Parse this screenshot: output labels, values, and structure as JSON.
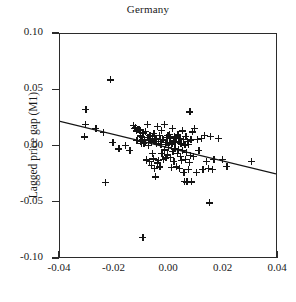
{
  "chart_data": {
    "type": "scatter",
    "title": "Germany",
    "xlabel": "",
    "ylabel": "Lagged price gap (M1)",
    "xlim": [
      -0.04,
      0.04
    ],
    "ylim": [
      -0.1,
      0.1
    ],
    "grid": false,
    "legend": null,
    "marker_style": "plus",
    "xticks": [
      "-0.04",
      "-0.02",
      "0.00",
      "0.02",
      "0.04"
    ],
    "xtick_values": [
      -0.04,
      -0.02,
      0.0,
      0.02,
      0.04
    ],
    "yticks": [
      "0.10",
      "0.05",
      "0.00",
      "-0.05",
      "-0.10"
    ],
    "ytick_values": [
      0.1,
      0.05,
      0.0,
      -0.05,
      -0.1
    ],
    "trend_line": {
      "type": "linear-fit",
      "x_start": -0.04,
      "y_start": 0.0217,
      "x_end": 0.04,
      "y_end": -0.0254,
      "slope": -0.589,
      "intercept": -0.00185
    },
    "points": [
      [
        -0.0305,
        0.0332
      ],
      [
        -0.0308,
        0.02
      ],
      [
        -0.031,
        0.0086
      ],
      [
        -0.0268,
        0.016
      ],
      [
        -0.0242,
        0.0125
      ],
      [
        -0.0234,
        -0.0321
      ],
      [
        -0.0215,
        0.0592
      ],
      [
        -0.0206,
        0.0037
      ],
      [
        -0.0184,
        -0.0022
      ],
      [
        -0.016,
        0.0008
      ],
      [
        -0.0144,
        -0.0037
      ],
      [
        -0.0131,
        0.0186
      ],
      [
        -0.0127,
        0.016
      ],
      [
        -0.0124,
        0.0171
      ],
      [
        -0.012,
        0.014
      ],
      [
        -0.0118,
        0.0052
      ],
      [
        -0.0114,
        0.0154
      ],
      [
        -0.011,
        0.0151
      ],
      [
        -0.0107,
        0.0144
      ],
      [
        -0.0105,
        0.0095
      ],
      [
        -0.0103,
        0.0047
      ],
      [
        -0.0101,
        0.003
      ],
      [
        -0.0099,
        0.0065
      ],
      [
        -0.0097,
        0.0084
      ],
      [
        -0.0096,
        -0.081
      ],
      [
        -0.0094,
        0.0122
      ],
      [
        -0.0092,
        0.0026
      ],
      [
        -0.009,
        0.0058
      ],
      [
        -0.0088,
        0.0136
      ],
      [
        -0.0086,
        0.004
      ],
      [
        -0.0084,
        -0.0115
      ],
      [
        -0.0082,
        -0.0125
      ],
      [
        -0.008,
        0.02
      ],
      [
        -0.0078,
        0.0083
      ],
      [
        -0.0076,
        0.0013
      ],
      [
        -0.0074,
        0.0062
      ],
      [
        -0.0072,
        -0.013
      ],
      [
        -0.007,
        0.0102
      ],
      [
        -0.0068,
        0.006
      ],
      [
        -0.0066,
        -0.017
      ],
      [
        -0.0064,
        0.0042
      ],
      [
        -0.0062,
        -0.006
      ],
      [
        -0.006,
        0.0091
      ],
      [
        -0.0058,
        -0.0109
      ],
      [
        -0.0056,
        0.012
      ],
      [
        -0.0054,
        -0.0193
      ],
      [
        -0.0052,
        0.0063
      ],
      [
        -0.005,
        -0.027
      ],
      [
        -0.0048,
        0.0073
      ],
      [
        -0.0046,
        0.0031
      ],
      [
        -0.0044,
        0.018
      ],
      [
        -0.0042,
        -0.0145
      ],
      [
        -0.004,
        0.0046
      ],
      [
        -0.0038,
        -0.0124
      ],
      [
        -0.0036,
        0.01
      ],
      [
        -0.0034,
        -0.0181
      ],
      [
        -0.0032,
        0.0065
      ],
      [
        -0.003,
        0.0021
      ],
      [
        -0.0028,
        0.0143
      ],
      [
        -0.0026,
        -0.006
      ],
      [
        -0.0024,
        0.0064
      ],
      [
        -0.0022,
        -0.0115
      ],
      [
        -0.002,
        0.0059
      ],
      [
        -0.0018,
        0.0194
      ],
      [
        -0.0016,
        -0.003
      ],
      [
        -0.0014,
        0.0022
      ],
      [
        -0.0012,
        -0.0102
      ],
      [
        -0.001,
        0.0081
      ],
      [
        -0.0008,
        0.0039
      ],
      [
        -0.0006,
        -0.0074
      ],
      [
        -0.0004,
        0.0102
      ],
      [
        -0.0002,
        -0.0005
      ],
      [
        0.0,
        0.011
      ],
      [
        0.0002,
        0.0035
      ],
      [
        0.0004,
        -0.0098
      ],
      [
        0.0006,
        0.007
      ],
      [
        0.0008,
        -0.0187
      ],
      [
        0.001,
        0.0024
      ],
      [
        0.0012,
        0.016
      ],
      [
        0.0014,
        -0.0043
      ],
      [
        0.0016,
        0.0051
      ],
      [
        0.0018,
        -0.0135
      ],
      [
        0.002,
        0.0086
      ],
      [
        0.0022,
        -0.002
      ],
      [
        0.0024,
        0.0041
      ],
      [
        0.0026,
        -0.0182
      ],
      [
        0.0028,
        0.0075
      ],
      [
        0.003,
        -0.0061
      ],
      [
        0.0032,
        0.0103
      ],
      [
        0.0034,
        -0.0026
      ],
      [
        0.0036,
        0.0048
      ],
      [
        0.0038,
        -0.0196
      ],
      [
        0.004,
        0.0074
      ],
      [
        0.0042,
        -0.0089
      ],
      [
        0.0044,
        0.0029
      ],
      [
        0.0046,
        -0.0125
      ],
      [
        0.0048,
        0.014
      ],
      [
        0.005,
        -0.0035
      ],
      [
        0.0052,
        0.0063
      ],
      [
        0.0054,
        -0.023
      ],
      [
        0.0056,
        -0.0308
      ],
      [
        0.0058,
        0.0014
      ],
      [
        0.006,
        -0.0117
      ],
      [
        0.0062,
        0.0092
      ],
      [
        0.0064,
        -0.0049
      ],
      [
        0.0066,
        -0.0315
      ],
      [
        0.0068,
        0.0043
      ],
      [
        0.007,
        -0.02
      ],
      [
        0.0072,
        0.002
      ],
      [
        0.0074,
        -0.0143
      ],
      [
        0.0076,
        0.0309
      ],
      [
        0.0078,
        -0.0078
      ],
      [
        0.008,
        0.0058
      ],
      [
        0.0082,
        -0.0315
      ],
      [
        0.0086,
        0.013
      ],
      [
        0.009,
        -0.0086
      ],
      [
        0.0094,
        0.016
      ],
      [
        0.01,
        -0.023
      ],
      [
        0.0104,
        0.0061
      ],
      [
        0.011,
        -0.0037
      ],
      [
        0.0118,
        0.007
      ],
      [
        0.0124,
        -0.02
      ],
      [
        0.013,
        0.0096
      ],
      [
        0.0138,
        -0.0129
      ],
      [
        0.0145,
        -0.0196
      ],
      [
        0.0148,
        -0.05
      ],
      [
        0.0152,
        0.0093
      ],
      [
        0.0158,
        -0.0205
      ],
      [
        0.0165,
        -0.0112
      ],
      [
        0.018,
        0.0072
      ],
      [
        0.0196,
        -0.0115
      ],
      [
        0.0212,
        -0.0175
      ],
      [
        0.0302,
        -0.0132
      ]
    ]
  },
  "caption": ""
}
